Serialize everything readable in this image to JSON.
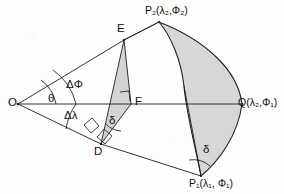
{
  "figure": {
    "background_color": "#fdfdfd",
    "stroke_color": "#1a1a1a",
    "fill_color": "#d6d6d6",
    "fill_color_dark": "#cccccc"
  },
  "points": [
    {
      "id": "O",
      "label": "O",
      "x": 18,
      "y": 104,
      "label_x": 8,
      "label_y": 98,
      "role": "sphere-center"
    },
    {
      "id": "E",
      "label": "E",
      "x": 124,
      "y": 40,
      "label_x": 118,
      "label_y": 24,
      "role": "vertex"
    },
    {
      "id": "F",
      "label": "F",
      "x": 131,
      "y": 104,
      "label_x": 136,
      "label_y": 97,
      "role": "foot-of-perpendicular"
    },
    {
      "id": "D",
      "label": "D",
      "x": 101,
      "y": 144,
      "label_x": 95,
      "label_y": 147,
      "role": "vertex"
    },
    {
      "id": "P2",
      "label": "P₂(λ₂,Φ₂)",
      "x": 159,
      "y": 22,
      "label_x": 146,
      "label_y": 6,
      "role": "geographic-point-2"
    },
    {
      "id": "P1",
      "label": "P₁(λ₁, Φ₁)",
      "x": 201,
      "y": 176,
      "label_x": 190,
      "label_y": 178,
      "role": "geographic-point-1"
    },
    {
      "id": "Q",
      "label": "Q(λ₂,Φ₁)",
      "x": 242,
      "y": 104,
      "label_x": 239,
      "label_y": 98,
      "role": "auxiliary-point"
    }
  ],
  "angles": [
    {
      "id": "theta",
      "label": "θ",
      "label_x": 50,
      "label_y": 94,
      "vertex": "O",
      "description": "angle at center between OQ and OE"
    },
    {
      "id": "delPhi",
      "label": "ΔΦ",
      "label_x": 70,
      "label_y": 81,
      "vertex": "O",
      "description": "latitude difference angle"
    },
    {
      "id": "delLam",
      "label": "Δλ",
      "label_x": 68,
      "label_y": 112,
      "vertex": "O",
      "description": "longitude difference angle"
    },
    {
      "id": "deltaD",
      "label": "δ",
      "label_x": 111,
      "label_y": 117,
      "vertex": "D",
      "description": "angle delta at D"
    },
    {
      "id": "deltaP1",
      "label": "δ",
      "label_x": 205,
      "label_y": 146,
      "vertex": "P1",
      "description": "angle delta at P1"
    }
  ],
  "segments": [
    {
      "from": "O",
      "to": "Q",
      "name": "axis-line-O-Q"
    },
    {
      "from": "O",
      "to": "E",
      "name": "ray-O-E"
    },
    {
      "from": "E",
      "to": "P2",
      "name": "segment-E-P2"
    },
    {
      "from": "O",
      "to": "D",
      "name": "ray-O-D"
    },
    {
      "from": "D",
      "to": "P1",
      "name": "segment-D-P1"
    },
    {
      "from": "E",
      "to": "F",
      "name": "segment-E-F"
    },
    {
      "from": "E",
      "to": "D",
      "name": "segment-E-D"
    },
    {
      "from": "D",
      "to": "F",
      "name": "segment-D-F"
    },
    {
      "from": "P2",
      "to": "Q",
      "name": "arc-P2-Q"
    },
    {
      "from": "Q",
      "to": "P1",
      "name": "arc-Q-P1"
    },
    {
      "from": "P2",
      "to": "P1",
      "name": "great-circle-arc-P2-P1"
    },
    {
      "from": "P1",
      "to": "F",
      "name": "segment-P1-F"
    }
  ],
  "shaded_regions": [
    {
      "name": "triangle-E-F-D",
      "vertices": [
        "E",
        "F",
        "D"
      ],
      "fill": "#d6d6d6"
    },
    {
      "name": "lens-P2-Q-P1",
      "vertices": [
        "P2",
        "Q",
        "P1"
      ],
      "fill": "#d6d6d6"
    },
    {
      "name": "sliver-P2-arc",
      "vertices": [
        "P2",
        "P1"
      ],
      "fill": "#cfcfcf"
    }
  ],
  "right_angle_marks": [
    {
      "name": "right-angle-at-F",
      "x": 120,
      "y": 93
    },
    {
      "name": "right-angle-at-D-upper",
      "x": 87,
      "y": 128
    },
    {
      "name": "right-angle-at-D-lower",
      "x": 107,
      "y": 133
    }
  ]
}
